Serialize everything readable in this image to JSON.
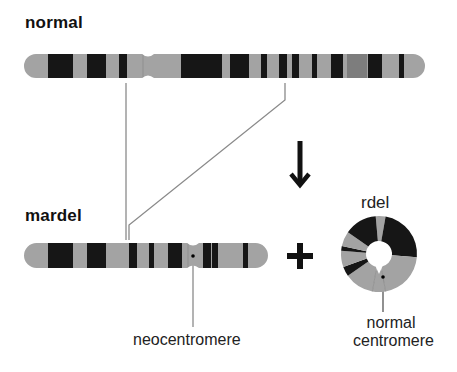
{
  "labels": {
    "normal_title": "normal",
    "mardel_title": "mardel",
    "rdel_title": "rdel",
    "neocentromere": "neocentromere",
    "normal_centromere_line1": "normal",
    "normal_centromere_line2": "centromere"
  },
  "symbols": {
    "arrow": "down-arrow-icon",
    "plus": "plus-icon"
  },
  "colors": {
    "chromosome_light": "#a3a3a3",
    "chromosome_dark": "#161616",
    "chromosome_medium": "#7d7d7d",
    "connector_line": "#8a8a8a",
    "text": "#111111"
  },
  "normal_chromosome": {
    "x_start": 24,
    "x_end": 425,
    "y_top": 54,
    "height": 24,
    "centromere_x": 148,
    "bands": [
      {
        "x": 48,
        "w": 25,
        "tone": "dark"
      },
      {
        "x": 87,
        "w": 19,
        "tone": "dark"
      },
      {
        "x": 119,
        "w": 8,
        "tone": "dark"
      },
      {
        "x": 181,
        "w": 41,
        "tone": "dark"
      },
      {
        "x": 230,
        "w": 19,
        "tone": "dark"
      },
      {
        "x": 261,
        "w": 6,
        "tone": "dark"
      },
      {
        "x": 279,
        "w": 8,
        "tone": "dark"
      },
      {
        "x": 292,
        "w": 7,
        "tone": "dark"
      },
      {
        "x": 312,
        "w": 5,
        "tone": "dark"
      },
      {
        "x": 331,
        "w": 12,
        "tone": "dark"
      },
      {
        "x": 347,
        "w": 20,
        "tone": "medium"
      },
      {
        "x": 368,
        "w": 14,
        "tone": "dark"
      },
      {
        "x": 399,
        "w": 5,
        "tone": "dark"
      }
    ]
  },
  "mardel_chromosome": {
    "x_start": 24,
    "x_end": 268,
    "y_top": 243,
    "height": 25,
    "neocentromere_x": 193,
    "bands": [
      {
        "x": 48,
        "w": 25,
        "tone": "dark"
      },
      {
        "x": 87,
        "w": 19,
        "tone": "dark"
      },
      {
        "x": 129,
        "w": 8,
        "tone": "dark"
      },
      {
        "x": 149,
        "w": 5,
        "tone": "dark"
      },
      {
        "x": 168,
        "w": 14,
        "tone": "dark"
      },
      {
        "x": 203,
        "w": 8,
        "tone": "dark"
      },
      {
        "x": 212,
        "w": 6,
        "tone": "dark"
      },
      {
        "x": 243,
        "w": 5,
        "tone": "dark"
      }
    ]
  },
  "ring_chromosome": {
    "cx": 379,
    "cy": 254,
    "r_outer": 38,
    "r_inner": 13,
    "segments": [
      {
        "from": -95,
        "to": -80,
        "tone": "light"
      },
      {
        "from": -80,
        "to": 5,
        "tone": "dark"
      },
      {
        "from": 5,
        "to": 80,
        "tone": "light"
      },
      {
        "from": 80,
        "to": 100,
        "tone": "light"
      },
      {
        "from": 100,
        "to": 145,
        "tone": "light"
      },
      {
        "from": 145,
        "to": 160,
        "tone": "dark"
      },
      {
        "from": 160,
        "to": 185,
        "tone": "light"
      },
      {
        "from": 185,
        "to": 192,
        "tone": "dark"
      },
      {
        "from": 192,
        "to": 215,
        "tone": "light"
      },
      {
        "from": 215,
        "to": 265,
        "tone": "dark"
      }
    ]
  }
}
